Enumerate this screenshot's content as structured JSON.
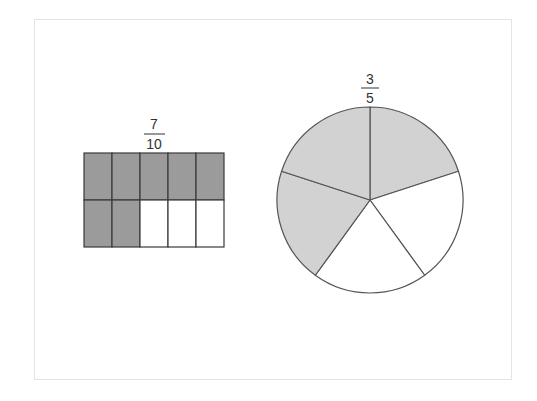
{
  "figure": {
    "rectangle_model": {
      "label": {
        "numerator": "7",
        "denominator": "10"
      },
      "rows": 2,
      "cols": 5,
      "shaded_count": 7,
      "shaded_color": "#9b9b9b",
      "unshaded_color": "#ffffff",
      "line_color": "#3a3a3a"
    },
    "circle_model": {
      "label": {
        "numerator": "3",
        "denominator": "5"
      },
      "sectors": 5,
      "shaded_count": 3,
      "shaded_color": "#d2d2d2",
      "unshaded_color": "#ffffff",
      "line_color": "#555555"
    }
  }
}
